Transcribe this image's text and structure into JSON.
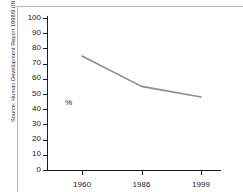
{
  "source_credit": "Source: Human Development Report 1998/9 (INP/UNDP)",
  "axis": {
    "y_label": "%",
    "y_ticks": [
      "0",
      "10",
      "20",
      "30",
      "40",
      "50",
      "60",
      "70",
      "80",
      "90",
      "100"
    ],
    "x_ticks": [
      "1960",
      "1986",
      "1999"
    ]
  },
  "colors": {
    "line": "#8c8c8c",
    "axis": "#1c1c1c",
    "frame": "#b9b9b9",
    "text": "#1a1a1a"
  },
  "chart_data": {
    "type": "line",
    "title": "",
    "xlabel": "",
    "ylabel": "%",
    "categories": [
      "1960",
      "1986",
      "1999"
    ],
    "x": [
      1960,
      1986,
      1999
    ],
    "values": [
      75,
      55,
      48
    ],
    "series": [
      {
        "name": "",
        "values": [
          75,
          55,
          48
        ]
      }
    ],
    "ylim": [
      0,
      100
    ],
    "ytick_step": 10,
    "grid": false,
    "legend": "none",
    "annotations": [
      "Source: Human Development Report 1998/9 (INP/UNDP)"
    ]
  }
}
